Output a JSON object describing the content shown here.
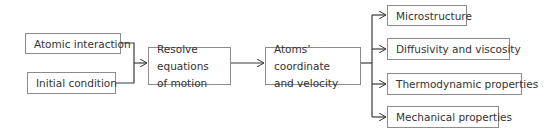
{
  "diagram": {
    "type": "flowchart",
    "direction": "left-to-right",
    "inputs": [
      {
        "id": "atomic_interaction",
        "label": "Atomic interaction"
      },
      {
        "id": "initial_condition",
        "label": "Initial condition"
      }
    ],
    "process": {
      "id": "resolve",
      "label": "Resolve equations of motion"
    },
    "intermediate": {
      "id": "atoms",
      "label": "Atoms’ coordinate and velocity"
    },
    "outputs": [
      {
        "id": "microstructure",
        "label": "Microstructure"
      },
      {
        "id": "diffusivity",
        "label": "Diffusivity and viscosity"
      },
      {
        "id": "thermodynamic",
        "label": "Thermodynamic properties"
      },
      {
        "id": "mechanical",
        "label": "Mechanical properties"
      }
    ],
    "edges": [
      [
        "atomic_interaction",
        "resolve"
      ],
      [
        "initial_condition",
        "resolve"
      ],
      [
        "resolve",
        "atoms"
      ],
      [
        "atoms",
        "microstructure"
      ],
      [
        "atoms",
        "diffusivity"
      ],
      [
        "atoms",
        "thermodynamic"
      ],
      [
        "atoms",
        "mechanical"
      ]
    ],
    "colors": {
      "line": "#3a3a3a",
      "border": "#8c8c8c",
      "text": "#333333"
    }
  }
}
